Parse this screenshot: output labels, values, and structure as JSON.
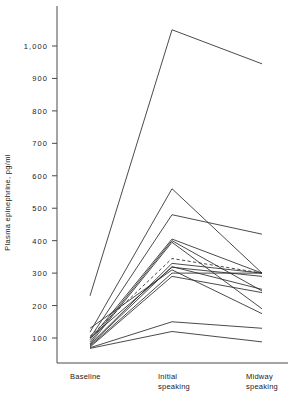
{
  "chart_data": {
    "type": "line",
    "title": "",
    "xlabel": "",
    "ylabel": "Plasma epinephrine, pg/ml",
    "categories": [
      "Baseline",
      "Initial speaking",
      "Midway speaking"
    ],
    "x_tick_labels": [
      {
        "line1": "Baseline",
        "line2": ""
      },
      {
        "line1": "Initial",
        "line2": "speaking"
      },
      {
        "line1": "Midway",
        "line2": "speaking"
      }
    ],
    "y_tick_labels": [
      "1,000",
      "900",
      "800",
      "700",
      "600",
      "500",
      "400",
      "300",
      "200",
      "100"
    ],
    "y_tick_values": [
      1000,
      900,
      800,
      700,
      600,
      500,
      400,
      300,
      200,
      100
    ],
    "ylim": [
      60,
      1075
    ],
    "grid": false,
    "legend": "none",
    "series_color": "#2b2b2b",
    "mean_series_style": "dashed",
    "series": [
      {
        "name": "subject-1",
        "values": [
          230,
          1050,
          945
        ],
        "style": "solid"
      },
      {
        "name": "subject-2",
        "values": [
          118,
          560,
          300
        ],
        "style": "solid"
      },
      {
        "name": "subject-3",
        "values": [
          100,
          480,
          420
        ],
        "style": "solid"
      },
      {
        "name": "subject-4",
        "values": [
          95,
          405,
          300
        ],
        "style": "solid"
      },
      {
        "name": "subject-5",
        "values": [
          88,
          400,
          245
        ],
        "style": "solid"
      },
      {
        "name": "subject-6",
        "values": [
          82,
          395,
          190
        ],
        "style": "solid"
      },
      {
        "name": "subject-7",
        "values": [
          80,
          330,
          300
        ],
        "style": "solid"
      },
      {
        "name": "subject-8",
        "values": [
          78,
          320,
          250
        ],
        "style": "solid"
      },
      {
        "name": "subject-9",
        "values": [
          100,
          318,
          290
        ],
        "style": "solid"
      },
      {
        "name": "subject-10",
        "values": [
          130,
          310,
          175
        ],
        "style": "solid"
      },
      {
        "name": "subject-11",
        "values": [
          75,
          300,
          300
        ],
        "style": "solid"
      },
      {
        "name": "subject-12",
        "values": [
          72,
          290,
          240
        ],
        "style": "solid"
      },
      {
        "name": "subject-13",
        "values": [
          70,
          150,
          130
        ],
        "style": "solid"
      },
      {
        "name": "subject-14",
        "values": [
          68,
          120,
          88
        ],
        "style": "solid"
      },
      {
        "name": "mean",
        "values": [
          105,
          345,
          300
        ],
        "style": "dashed"
      }
    ]
  }
}
